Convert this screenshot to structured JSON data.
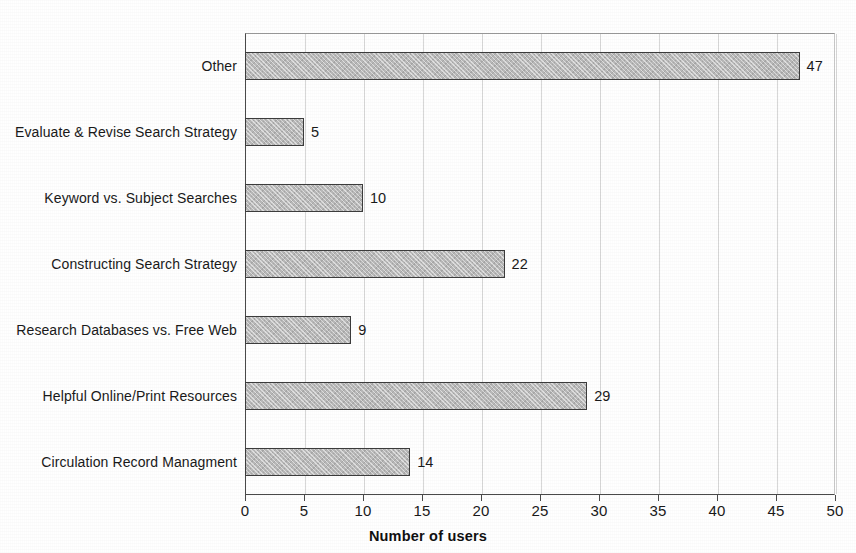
{
  "chart_data": {
    "type": "bar",
    "orientation": "horizontal",
    "title": "",
    "xlabel": "Number of users",
    "ylabel": "",
    "xlim": [
      0,
      50
    ],
    "xticks": [
      0,
      5,
      10,
      15,
      20,
      25,
      30,
      35,
      40,
      45,
      50
    ],
    "grid": "vertical",
    "legend": "none",
    "categories": [
      "Other",
      "Evaluate & Revise Search Strategy",
      "Keyword vs. Subject Searches",
      "Constructing Search Strategy",
      "Research Databases vs. Free Web",
      "Helpful Online/Print Resources",
      "Circulation Record Managment"
    ],
    "values": [
      47,
      5,
      10,
      22,
      9,
      29,
      14
    ],
    "value_labels": [
      "47",
      "5",
      "10",
      "22",
      "9",
      "29",
      "14"
    ],
    "bar_color": "#b9b9b9",
    "bar_border_color": "#3c3c3c",
    "axis_color": "#4a4a4a",
    "grid_color": "#d8d8d8",
    "text_color": "#1a1a1a"
  }
}
